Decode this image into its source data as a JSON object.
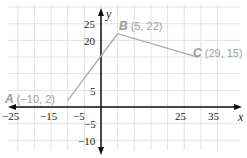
{
  "chart_data": {
    "type": "line",
    "title": "",
    "xlabel": "x",
    "ylabel": "y",
    "xlim": [
      -27,
      40
    ],
    "ylim": [
      -13,
      28
    ],
    "grid": true,
    "x_ticks": [
      "-25",
      "-15",
      "-5",
      "25",
      "35"
    ],
    "y_ticks": [
      "25",
      "20",
      "5",
      "-5",
      "-10"
    ],
    "series": [
      {
        "name": "ABC",
        "x": [
          -10,
          5,
          29
        ],
        "y": [
          2,
          22,
          15
        ]
      }
    ],
    "points": [
      {
        "name": "A",
        "label": "(−10, 2)",
        "x": -10,
        "y": 2
      },
      {
        "name": "B",
        "label": "(5, 22)",
        "x": 5,
        "y": 22
      },
      {
        "name": "C",
        "label": "(29, 15)",
        "x": 29,
        "y": 15
      }
    ]
  }
}
